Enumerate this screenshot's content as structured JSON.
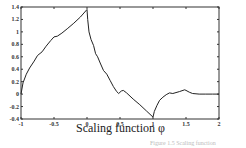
{
  "chart_data": {
    "type": "line",
    "title": "",
    "xlabel": "Scaling function φ",
    "ylabel": "",
    "xlim": [
      -1,
      2
    ],
    "ylim": [
      -0.4,
      1.4
    ],
    "grid": false,
    "legend": null,
    "x_ticks": [
      -1,
      -0.5,
      0,
      0.5,
      1,
      1.5,
      2
    ],
    "x_tick_labels": [
      "-1",
      "-0.5",
      "0",
      "0.5",
      "1",
      "1.5",
      "2"
    ],
    "y_ticks": [
      -0.4,
      -0.2,
      0,
      0.2,
      0.4,
      0.6,
      0.8,
      1,
      1.2,
      1.4
    ],
    "y_tick_labels": [
      "-0.4",
      "-0.2",
      "0",
      "0.2",
      "0.4",
      "0.6",
      "0.8",
      "1",
      "1.2",
      "1.4"
    ],
    "series": [
      {
        "name": "phi",
        "x": [
          -1,
          -0.97,
          -0.92,
          -0.87,
          -0.8,
          -0.75,
          -0.68,
          -0.62,
          -0.55,
          -0.5,
          -0.45,
          -0.38,
          -0.3,
          -0.2,
          -0.1,
          0,
          0.01,
          0.03,
          0.06,
          0.1,
          0.13,
          0.16,
          0.2,
          0.25,
          0.3,
          0.35,
          0.4,
          0.45,
          0.48,
          0.52,
          0.55,
          0.6,
          0.7,
          0.8,
          0.9,
          1.0,
          1.02,
          1.06,
          1.1,
          1.15,
          1.2,
          1.25,
          1.3,
          1.4,
          1.48,
          1.5,
          1.55,
          1.6,
          1.7,
          1.8,
          1.9,
          2.0
        ],
        "y": [
          0.0,
          0.18,
          0.32,
          0.42,
          0.53,
          0.62,
          0.68,
          0.77,
          0.86,
          0.92,
          0.93,
          0.98,
          1.05,
          1.14,
          1.24,
          1.36,
          1.2,
          1.0,
          0.88,
          0.78,
          0.65,
          0.6,
          0.5,
          0.38,
          0.32,
          0.22,
          0.12,
          0.04,
          0.01,
          0.05,
          0.06,
          0.02,
          -0.08,
          -0.17,
          -0.27,
          -0.37,
          -0.28,
          -0.18,
          -0.1,
          -0.05,
          -0.01,
          0.02,
          0.01,
          0.04,
          0.07,
          0.06,
          0.03,
          0.01,
          0.0,
          0.0,
          0.0,
          0.0
        ]
      }
    ]
  },
  "caption": "Figure 1.5  Scaling function"
}
